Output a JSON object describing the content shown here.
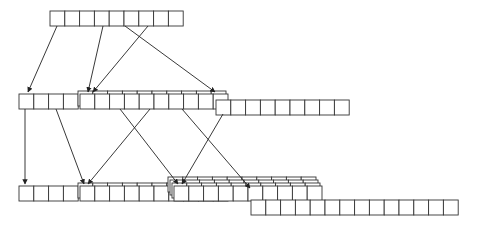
{
  "diagram": {
    "title": "",
    "colors": {
      "stroke": "#333333",
      "fill": "#ffffff",
      "arrow": "#222222"
    },
    "cell_width": 14.8,
    "cell_height": 15,
    "rows": [
      {
        "name": "level-0",
        "groups": [
          {
            "x": 50,
            "y": 11,
            "cells": 9,
            "layers": 1
          }
        ]
      },
      {
        "name": "level-1",
        "groups": [
          {
            "x": 19,
            "y": 94,
            "cells": 4,
            "layers": 1
          },
          {
            "x": 80,
            "y": 94,
            "cells": 10,
            "layers": 2
          },
          {
            "x": 216,
            "y": 100,
            "cells": 9,
            "layers": 1
          }
        ]
      },
      {
        "name": "level-2",
        "groups": [
          {
            "x": 19,
            "y": 186,
            "cells": 4,
            "layers": 1
          },
          {
            "x": 80,
            "y": 186,
            "cells": 10,
            "layers": 2
          },
          {
            "x": 174,
            "y": 186,
            "cells": 10,
            "layers": 4
          },
          {
            "x": 251,
            "y": 200,
            "cells": 14,
            "layers": 1
          }
        ]
      }
    ],
    "arrows": [
      {
        "x1": 57,
        "y1": 26,
        "x2": 28,
        "y2": 92
      },
      {
        "x1": 103,
        "y1": 26,
        "x2": 88,
        "y2": 92
      },
      {
        "x1": 148,
        "y1": 26,
        "x2": 93,
        "y2": 92
      },
      {
        "x1": 125,
        "y1": 26,
        "x2": 215,
        "y2": 92
      },
      {
        "x1": 25,
        "y1": 109,
        "x2": 25,
        "y2": 184
      },
      {
        "x1": 56,
        "y1": 109,
        "x2": 84,
        "y2": 184
      },
      {
        "x1": 150,
        "y1": 109,
        "x2": 88,
        "y2": 184
      },
      {
        "x1": 120,
        "y1": 109,
        "x2": 178,
        "y2": 184
      },
      {
        "x1": 182,
        "y1": 109,
        "x2": 250,
        "y2": 188
      },
      {
        "x1": 223,
        "y1": 114,
        "x2": 182,
        "y2": 184
      }
    ]
  }
}
